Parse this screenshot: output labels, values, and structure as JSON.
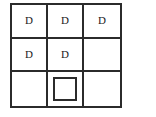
{
  "diagram": {
    "type": "grid-3x3",
    "title": "",
    "rows": 3,
    "columns": 3,
    "colors": {
      "line": "#2b2b2b",
      "background": "#ffffff",
      "text": "#1a1a1a"
    },
    "cells": [
      {
        "row": 1,
        "col": 1,
        "content": "letter",
        "label": "D"
      },
      {
        "row": 1,
        "col": 2,
        "content": "letter",
        "label": "D"
      },
      {
        "row": 1,
        "col": 3,
        "content": "letter",
        "label": "D"
      },
      {
        "row": 2,
        "col": 1,
        "content": "letter",
        "label": "D"
      },
      {
        "row": 2,
        "col": 2,
        "content": "letter",
        "label": "D"
      },
      {
        "row": 2,
        "col": 3,
        "content": "empty",
        "label": ""
      },
      {
        "row": 3,
        "col": 1,
        "content": "empty",
        "label": ""
      },
      {
        "row": 3,
        "col": 2,
        "content": "square",
        "label": ""
      },
      {
        "row": 3,
        "col": 3,
        "content": "empty",
        "label": ""
      }
    ]
  }
}
